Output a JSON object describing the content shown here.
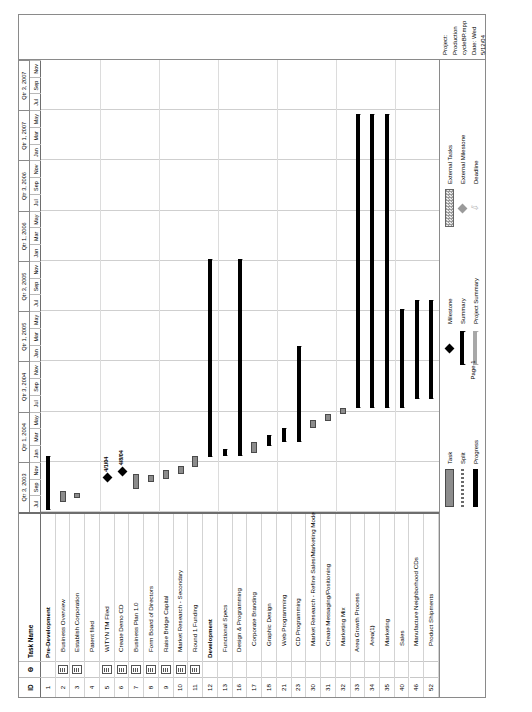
{
  "document": {
    "app": "Microsoft Project",
    "page_label": "Page 1",
    "project_line": "Project: Production cycleBP.mpp",
    "date_line": "Date: Wed 5/12/04"
  },
  "table": {
    "headers": {
      "id": "ID",
      "indicator": "Θ",
      "name": "Task Name"
    },
    "rows": [
      {
        "id": "1",
        "name": "Pre-Development",
        "level": 0,
        "note": false
      },
      {
        "id": "2",
        "name": "Business Overview",
        "level": 1,
        "note": true
      },
      {
        "id": "3",
        "name": "Establish Corporation",
        "level": 1,
        "note": true
      },
      {
        "id": "4",
        "name": "Patent filed",
        "level": 1,
        "note": false
      },
      {
        "id": "5",
        "name": "WITYN TM Filed",
        "level": 1,
        "note": true
      },
      {
        "id": "6",
        "name": "Create Demo CD",
        "level": 1,
        "note": true
      },
      {
        "id": "7",
        "name": "Business Plan 1.0",
        "level": 1,
        "note": true
      },
      {
        "id": "8",
        "name": "Form Board of Directors",
        "level": 1,
        "note": true
      },
      {
        "id": "9",
        "name": "Raise Bridge Capital",
        "level": 1,
        "note": true
      },
      {
        "id": "10",
        "name": "Market Research - Secondary",
        "level": 1,
        "note": true
      },
      {
        "id": "11",
        "name": "Round 1 Funding",
        "level": 1,
        "note": true
      },
      {
        "id": "12",
        "name": "Development",
        "level": 0,
        "note": false
      },
      {
        "id": "13",
        "name": "Functional Specs",
        "level": 1,
        "note": false
      },
      {
        "id": "16",
        "name": "Design & Programming",
        "level": 1,
        "note": false
      },
      {
        "id": "17",
        "name": "Corporate Branding",
        "level": 2,
        "note": false
      },
      {
        "id": "18",
        "name": "Graphic Design",
        "level": 2,
        "note": false
      },
      {
        "id": "21",
        "name": "Web Programming",
        "level": 2,
        "note": false
      },
      {
        "id": "23",
        "name": "CD Programming",
        "level": 2,
        "note": false
      },
      {
        "id": "30",
        "name": "Market Research - Refine Sales/Marketing Model",
        "level": 2,
        "note": false
      },
      {
        "id": "31",
        "name": "Create Messaging/Positioning",
        "level": 2,
        "note": false
      },
      {
        "id": "32",
        "name": "Marketing Mix",
        "level": 2,
        "note": false
      },
      {
        "id": "33",
        "name": "Area Growth Process",
        "level": 1,
        "note": false
      },
      {
        "id": "34",
        "name": "Area(1)",
        "level": 2,
        "note": false
      },
      {
        "id": "35",
        "name": "Marketing",
        "level": 2,
        "note": false
      },
      {
        "id": "40",
        "name": "Sales",
        "level": 2,
        "note": false
      },
      {
        "id": "46",
        "name": "Manufacture Neighborhood CDs",
        "level": 2,
        "note": false
      },
      {
        "id": "52",
        "name": "Product Shipments",
        "level": 2,
        "note": false
      }
    ]
  },
  "timeline": {
    "quarters": [
      {
        "label": "Qtr 3, 2003",
        "months": [
          "Jul",
          "Sep",
          "Nov"
        ]
      },
      {
        "label": "Qtr 1, 2004",
        "months": [
          "Jan",
          "Mar",
          "May"
        ]
      },
      {
        "label": "Qtr 3, 2004",
        "months": [
          "Jul",
          "Sep",
          "Nov"
        ]
      },
      {
        "label": "Qtr 1, 2005",
        "months": [
          "Jan",
          "Mar",
          "May"
        ]
      },
      {
        "label": "Qtr 3, 2005",
        "months": [
          "Jul",
          "Sep",
          "Nov"
        ]
      },
      {
        "label": "Qtr 1, 2006",
        "months": [
          "Jan",
          "Mar",
          "May"
        ]
      },
      {
        "label": "Qtr 3, 2006",
        "months": [
          "Jul",
          "Sep",
          "Nov"
        ]
      },
      {
        "label": "Qtr 1, 2007",
        "months": [
          "Jan",
          "Mar",
          "May"
        ]
      },
      {
        "label": "Qtr 3, 2007",
        "months": [
          "Jul",
          "Sep",
          "Nov"
        ]
      }
    ]
  },
  "chart_data": {
    "type": "bar",
    "xlabel": "",
    "ylabel": "",
    "axis_start": "2003-07",
    "axis_end": "2007-12",
    "bars": [
      {
        "row": "1",
        "name": "Pre-Development",
        "kind": "summary",
        "start_pct": 0.4,
        "end_pct": 12.5
      },
      {
        "row": "2",
        "name": "Business Overview",
        "kind": "task",
        "start_pct": 2.2,
        "end_pct": 4.6
      },
      {
        "row": "3",
        "name": "Establish Corporation",
        "kind": "task",
        "start_pct": 3.2,
        "end_pct": 4.3
      },
      {
        "row": "4",
        "name": "Patent filed",
        "kind": "none",
        "start_pct": 0,
        "end_pct": 0
      },
      {
        "row": "5",
        "name": "WITYN TM Filed",
        "kind": "milestone",
        "start_pct": 7.6,
        "end_pct": 7.6,
        "label": "4/1/04"
      },
      {
        "row": "6",
        "name": "Create Demo CD",
        "kind": "milestone",
        "start_pct": 9.0,
        "end_pct": 9.0,
        "label": "4/8/04"
      },
      {
        "row": "7",
        "name": "Business Plan 1.0",
        "kind": "task",
        "start_pct": 5.0,
        "end_pct": 8.4
      },
      {
        "row": "8",
        "name": "Form Board of Directors",
        "kind": "task",
        "start_pct": 6.6,
        "end_pct": 8.2
      },
      {
        "row": "9",
        "name": "Raise Bridge Capital",
        "kind": "task",
        "start_pct": 7.3,
        "end_pct": 9.4
      },
      {
        "row": "10",
        "name": "Market Research - Secondary",
        "kind": "task",
        "start_pct": 8.4,
        "end_pct": 10.1
      },
      {
        "row": "11",
        "name": "Round 1 Funding",
        "kind": "task",
        "start_pct": 10.0,
        "end_pct": 12.4
      },
      {
        "row": "12",
        "name": "Development",
        "kind": "summary",
        "start_pct": 12.2,
        "end_pct": 56.0
      },
      {
        "row": "13",
        "name": "Functional Specs",
        "kind": "summary",
        "start_pct": 12.3,
        "end_pct": 14.0
      },
      {
        "row": "16",
        "name": "Design & Programming",
        "kind": "summary",
        "start_pct": 12.3,
        "end_pct": 56.0
      },
      {
        "row": "17",
        "name": "Corporate Branding",
        "kind": "task",
        "start_pct": 13.0,
        "end_pct": 15.4
      },
      {
        "row": "18",
        "name": "Graphic Design",
        "kind": "summary",
        "start_pct": 14.6,
        "end_pct": 17.0
      },
      {
        "row": "21",
        "name": "Web Programming",
        "kind": "summary",
        "start_pct": 15.4,
        "end_pct": 18.6
      },
      {
        "row": "23",
        "name": "CD Programming",
        "kind": "summary",
        "start_pct": 15.4,
        "end_pct": 36.8
      },
      {
        "row": "30",
        "name": "Market Research - Refine Sales/Marketing Model",
        "kind": "task",
        "start_pct": 18.6,
        "end_pct": 20.4
      },
      {
        "row": "31",
        "name": "Create Messaging/Positioning",
        "kind": "task",
        "start_pct": 20.2,
        "end_pct": 21.6
      },
      {
        "row": "32",
        "name": "Marketing Mix",
        "kind": "task",
        "start_pct": 21.6,
        "end_pct": 23.0
      },
      {
        "row": "33",
        "name": "Area Growth Process",
        "kind": "summary",
        "start_pct": 23.0,
        "end_pct": 88.0
      },
      {
        "row": "34",
        "name": "Area(1)",
        "kind": "summary",
        "start_pct": 23.0,
        "end_pct": 88.0
      },
      {
        "row": "35",
        "name": "Marketing",
        "kind": "summary",
        "start_pct": 23.0,
        "end_pct": 88.0
      },
      {
        "row": "40",
        "name": "Sales",
        "kind": "summary",
        "start_pct": 23.0,
        "end_pct": 45.0
      },
      {
        "row": "46",
        "name": "Manufacture Neighborhood CDs",
        "kind": "summary",
        "start_pct": 25.0,
        "end_pct": 47.0
      },
      {
        "row": "52",
        "name": "Product Shipments",
        "kind": "summary",
        "start_pct": 25.0,
        "end_pct": 47.0
      }
    ]
  },
  "legend": {
    "items": [
      {
        "label": "Task",
        "swatch": "task"
      },
      {
        "label": "Split",
        "swatch": "split"
      },
      {
        "label": "Progress",
        "swatch": "progress"
      },
      {
        "label": "Milestone",
        "swatch": "milestone"
      },
      {
        "label": "Summary",
        "swatch": "summary"
      },
      {
        "label": "Project Summary",
        "swatch": "project-summary"
      },
      {
        "label": "External Tasks",
        "swatch": "external-tasks"
      },
      {
        "label": "External Milestone",
        "swatch": "external-milestone"
      },
      {
        "label": "Deadline",
        "swatch": "deadline"
      }
    ]
  },
  "colors": {
    "task_fill": "#8c8c8c",
    "task_border": "#4a4a4a",
    "summary": "#000000",
    "project_summary": "#a8a8a8",
    "grid": "#dcdcdc",
    "frame": "#8a8a8a"
  }
}
